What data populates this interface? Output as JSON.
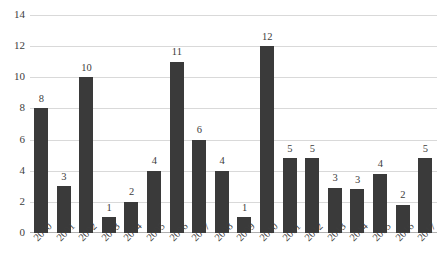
{
  "chart_data": {
    "type": "bar",
    "title": "",
    "subtitle": "",
    "xlabel": "",
    "ylabel": "",
    "ylim": [
      0,
      14
    ],
    "ytick_step": 2,
    "yticks": [
      "0",
      "2",
      "4",
      "6",
      "8",
      "10",
      "12",
      "14"
    ],
    "grid": true,
    "legend": false,
    "bar_color": "#3a3a3a",
    "gridline_color": "#d9d9d9",
    "text_color": "#3d3d3d",
    "categories": [
      "2000",
      "2001",
      "2002",
      "2003",
      "2004",
      "2005",
      "2006",
      "2007",
      "2008",
      "2009",
      "2010",
      "2011",
      "2012",
      "2013",
      "2014",
      "2015",
      "2016",
      "2017"
    ],
    "values": [
      8,
      3,
      10,
      1,
      2,
      4,
      11,
      6,
      4,
      1,
      12,
      5,
      5,
      3,
      3,
      4,
      2,
      5
    ],
    "data_labels": [
      "8",
      "3",
      "10",
      "1",
      "2",
      "4",
      "11",
      "6",
      "4",
      "1",
      "12",
      "5",
      "5",
      "3",
      "3",
      "4",
      "2",
      "5"
    ],
    "drawn_heights": [
      8,
      3,
      10,
      1,
      2,
      4,
      11,
      6,
      4,
      1,
      12,
      4.8,
      4.8,
      2.9,
      2.8,
      3.8,
      1.8,
      4.8
    ]
  }
}
